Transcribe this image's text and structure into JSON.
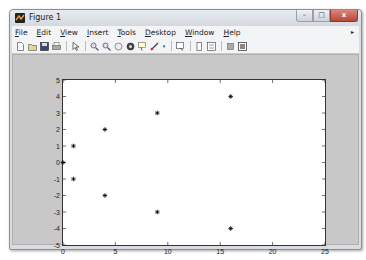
{
  "window": {
    "title": "Figure 1",
    "controls": {
      "minimize": "–",
      "maximize": "□",
      "close": "x"
    }
  },
  "menubar": {
    "items": [
      {
        "label": "File",
        "mnemonic": "F"
      },
      {
        "label": "Edit",
        "mnemonic": "E"
      },
      {
        "label": "View",
        "mnemonic": "V"
      },
      {
        "label": "Insert",
        "mnemonic": "I"
      },
      {
        "label": "Tools",
        "mnemonic": "T"
      },
      {
        "label": "Desktop",
        "mnemonic": "D"
      },
      {
        "label": "Window",
        "mnemonic": "W"
      },
      {
        "label": "Help",
        "mnemonic": "H"
      }
    ]
  },
  "toolbar": {
    "icons": [
      "new-figure-icon",
      "open-file-icon",
      "save-icon",
      "print-icon",
      "pointer-icon",
      "zoom-in-icon",
      "zoom-out-icon",
      "pan-icon",
      "rotate-3d-icon",
      "data-cursor-icon",
      "brush-icon",
      "link-plot-icon",
      "colorbar-icon",
      "legend-icon",
      "hide-plot-tools-icon",
      "show-plot-tools-icon"
    ]
  },
  "chart_data": {
    "type": "scatter",
    "title": "",
    "xlabel": "",
    "ylabel": "",
    "marker": "*",
    "marker_color": "#000000",
    "xlim": [
      0,
      25
    ],
    "ylim": [
      -5,
      5
    ],
    "xticks": [
      0,
      5,
      10,
      15,
      20,
      25
    ],
    "yticks": [
      -5,
      -4,
      -3,
      -2,
      -1,
      0,
      1,
      2,
      3,
      4,
      5
    ],
    "grid": false,
    "legend": null,
    "series": [
      {
        "name": "data1",
        "points": [
          {
            "x": 0,
            "y": 0
          },
          {
            "x": 1,
            "y": 1
          },
          {
            "x": 1,
            "y": -1
          },
          {
            "x": 4,
            "y": 2
          },
          {
            "x": 4,
            "y": -2
          },
          {
            "x": 9,
            "y": 3
          },
          {
            "x": 9,
            "y": -3
          },
          {
            "x": 16,
            "y": 4
          },
          {
            "x": 16,
            "y": -4
          }
        ]
      }
    ]
  }
}
